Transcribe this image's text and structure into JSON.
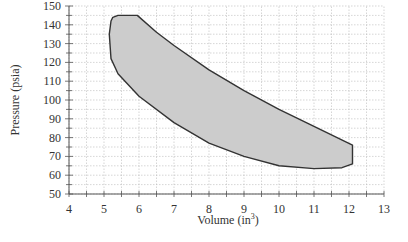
{
  "chart_data": {
    "type": "area",
    "title": "",
    "xlabel": "Volume (in³)",
    "xlabel_base": "Volume  (in",
    "xlabel_sup": "3",
    "xlabel_close": ")",
    "ylabel": "Pressure (psia)",
    "xlim": [
      4,
      13
    ],
    "ylim": [
      50,
      150
    ],
    "x_ticks": [
      4,
      5,
      6,
      7,
      8,
      9,
      10,
      11,
      12,
      13
    ],
    "y_ticks": [
      50,
      60,
      70,
      80,
      90,
      100,
      110,
      120,
      130,
      140,
      150
    ],
    "grid": true,
    "legend": null,
    "series": [
      {
        "name": "P-V cycle region",
        "fill": "#cccccc",
        "stroke": "#333333",
        "points": [
          [
            5.25,
            144
          ],
          [
            5.4,
            145
          ],
          [
            5.95,
            145
          ],
          [
            6.5,
            136
          ],
          [
            7,
            129
          ],
          [
            8,
            116
          ],
          [
            9,
            105
          ],
          [
            10,
            95
          ],
          [
            11,
            86
          ],
          [
            12.1,
            76
          ],
          [
            12.1,
            66
          ],
          [
            11.8,
            64
          ],
          [
            11,
            63.5
          ],
          [
            10,
            65
          ],
          [
            9,
            70
          ],
          [
            8,
            77
          ],
          [
            7,
            88
          ],
          [
            6,
            102
          ],
          [
            5.4,
            114
          ],
          [
            5.2,
            122
          ],
          [
            5.15,
            135
          ],
          [
            5.2,
            142
          ]
        ]
      }
    ]
  },
  "colors": {
    "fill": "#cccccc",
    "outline": "#333333",
    "grid": "#bbbbbb",
    "axis": "#555555"
  }
}
